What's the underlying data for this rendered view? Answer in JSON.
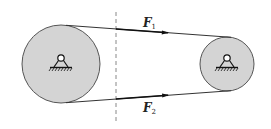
{
  "diagram": {
    "forces": [
      {
        "symbol": "F",
        "subscript": "1",
        "position": "top"
      },
      {
        "symbol": "F",
        "subscript": "2",
        "position": "bottom"
      }
    ],
    "pulleys": [
      {
        "name": "large-pulley",
        "support": "pin support"
      },
      {
        "name": "small-pulley",
        "support": "pin support"
      }
    ],
    "colors": {
      "pulley_fill": "#d4d4d4",
      "line": "#333333",
      "dashed_line": "#888888"
    }
  }
}
